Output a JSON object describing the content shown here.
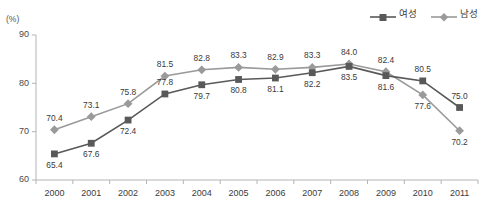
{
  "chart_data": {
    "type": "line",
    "title": "",
    "xlabel": "",
    "ylabel": "(%)",
    "unit_label": "(%)",
    "categories": [
      "2000",
      "2001",
      "2002",
      "2003",
      "2004",
      "2005",
      "2006",
      "2007",
      "2008",
      "2009",
      "2010",
      "2011"
    ],
    "ylim": [
      60,
      90
    ],
    "yticks": [
      60,
      70,
      80,
      90
    ],
    "grid": false,
    "legend_position": "top-right",
    "series": [
      {
        "name": "여성",
        "marker": "square",
        "color": "#595959",
        "values": [
          65.4,
          67.6,
          72.4,
          77.8,
          79.7,
          80.8,
          81.1,
          82.2,
          83.5,
          81.6,
          80.5,
          75.0
        ],
        "labels": [
          "65.4",
          "67.6",
          "72.4",
          "77.8",
          "79.7",
          "80.8",
          "81.1",
          "82.2",
          "83.5",
          "81.6",
          "80.5",
          "75.0"
        ]
      },
      {
        "name": "남성",
        "marker": "diamond",
        "color": "#9a9a9a",
        "values": [
          70.4,
          73.1,
          75.8,
          81.5,
          82.8,
          83.3,
          82.9,
          83.3,
          84.0,
          82.4,
          77.6,
          70.2
        ],
        "labels": [
          "70.4",
          "73.1",
          "75.8",
          "81.5",
          "82.8",
          "83.3",
          "82.9",
          "83.3",
          "84.0",
          "82.4",
          "77.6",
          "70.2"
        ]
      }
    ]
  },
  "legend": {
    "items": [
      {
        "label": "여성",
        "icon": "square-marker-icon",
        "color": "#595959"
      },
      {
        "label": "남성",
        "icon": "diamond-marker-icon",
        "color": "#9a9a9a"
      }
    ]
  },
  "axes": {
    "y_unit": "(%)",
    "y_tick_labels": [
      "90",
      "80",
      "70",
      "60"
    ],
    "x_tick_labels": [
      "2000",
      "2001",
      "2002",
      "2003",
      "2004",
      "2005",
      "2006",
      "2007",
      "2008",
      "2009",
      "2010",
      "2011"
    ]
  }
}
